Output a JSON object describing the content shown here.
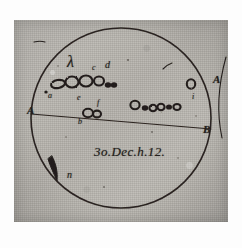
{
  "document": {
    "kind": "historical-astronomical-drawing",
    "subject": "sunspot observation sketch",
    "date_inscription": "3o.Dec.h.12.",
    "paper_color": "#b8b5b0",
    "ink_color": "#241f1c"
  },
  "disk": {
    "name": "solar-disk",
    "center_x": 121,
    "center_y": 118,
    "radius": 90
  },
  "diameter_line": {
    "label_left": "A",
    "label_right": "B",
    "x1": 31,
    "y1": 114,
    "x2": 211,
    "y2": 129
  },
  "marginal_labels": [
    {
      "text": "A",
      "x": 27,
      "y": 105,
      "size": "cap"
    },
    {
      "text": "B",
      "x": 203,
      "y": 124,
      "size": "cap"
    },
    {
      "text": "A",
      "x": 213,
      "y": 74,
      "size": "cap"
    }
  ],
  "spot_labels": [
    {
      "text": "λ",
      "x": 67,
      "y": 54,
      "size": "glyph"
    },
    {
      "text": "c",
      "x": 92,
      "y": 64,
      "size": "small"
    },
    {
      "text": "d",
      "x": 105,
      "y": 60,
      "size": "mid"
    },
    {
      "text": "a",
      "x": 48,
      "y": 92,
      "size": "small"
    },
    {
      "text": "e",
      "x": 77,
      "y": 94,
      "size": "small"
    },
    {
      "text": "f",
      "x": 97,
      "y": 99,
      "size": "small"
    },
    {
      "text": "b",
      "x": 78,
      "y": 118,
      "size": "small"
    },
    {
      "text": "i",
      "x": 192,
      "y": 93,
      "size": "small"
    },
    {
      "text": "n",
      "x": 67,
      "y": 170,
      "size": "mid"
    }
  ],
  "date_text": {
    "text": "3o.Dec.h.12.",
    "x": 94,
    "y": 145
  },
  "spot_groups": [
    {
      "name": "upper-left-cluster",
      "spots": [
        {
          "cx": 58,
          "cy": 84,
          "rx": 7.0,
          "ry": 4.0,
          "rot": -10,
          "filled": false
        },
        {
          "cx": 72,
          "cy": 82,
          "rx": 6.5,
          "ry": 5.5,
          "rot": 0,
          "filled": false
        },
        {
          "cx": 86,
          "cy": 81,
          "rx": 6.5,
          "ry": 5.5,
          "rot": 0,
          "filled": false
        },
        {
          "cx": 99,
          "cy": 81,
          "rx": 5.0,
          "ry": 4.5,
          "rot": 0,
          "filled": false
        },
        {
          "cx": 108,
          "cy": 85,
          "rx": 3.2,
          "ry": 2.8,
          "rot": 0,
          "filled": true
        },
        {
          "cx": 114,
          "cy": 85,
          "rx": 3.2,
          "ry": 2.8,
          "rot": 0,
          "filled": true
        },
        {
          "cx": 46,
          "cy": 92,
          "rx": 1.7,
          "ry": 1.5,
          "rot": 0,
          "filled": true
        }
      ]
    },
    {
      "name": "center-lower-pair",
      "spots": [
        {
          "cx": 88,
          "cy": 113,
          "rx": 5.0,
          "ry": 4.2,
          "rot": 0,
          "filled": false
        },
        {
          "cx": 97,
          "cy": 114,
          "rx": 4.0,
          "ry": 3.4,
          "rot": 0,
          "filled": false
        }
      ]
    },
    {
      "name": "right-chain",
      "spots": [
        {
          "cx": 135,
          "cy": 105,
          "rx": 4.6,
          "ry": 4.2,
          "rot": 0,
          "filled": false
        },
        {
          "cx": 145,
          "cy": 108,
          "rx": 3.2,
          "ry": 2.8,
          "rot": 0,
          "filled": true
        },
        {
          "cx": 153,
          "cy": 108,
          "rx": 3.6,
          "ry": 3.2,
          "rot": 0,
          "filled": false
        },
        {
          "cx": 161,
          "cy": 107,
          "rx": 3.6,
          "ry": 3.2,
          "rot": 0,
          "filled": false
        },
        {
          "cx": 169,
          "cy": 107,
          "rx": 3.0,
          "ry": 2.6,
          "rot": 0,
          "filled": true
        },
        {
          "cx": 177,
          "cy": 107,
          "rx": 3.6,
          "ry": 3.0,
          "rot": 0,
          "filled": false
        }
      ]
    },
    {
      "name": "right-edge-spot",
      "spots": [
        {
          "cx": 191,
          "cy": 84,
          "rx": 4.2,
          "ry": 4.8,
          "rot": 0,
          "filled": false
        }
      ]
    }
  ],
  "strokes": [
    {
      "name": "crescent-mark-lower-left",
      "d": "M 52,156 C 56,164 58,172 57,181 C 54,174 50,166 48,159 Z"
    },
    {
      "name": "faint-stroke-upper-right",
      "d": "M 163,69 C 166,66 169,64 172,63"
    },
    {
      "name": "faint-mark-top-left",
      "d": "M 34,42 C 38,41 42,41 45,42"
    },
    {
      "name": "edge-curve-right",
      "d": "M 226,57 C 219,82 216,110 222,138"
    }
  ],
  "speck_dots": [
    {
      "cx": 128,
      "cy": 60,
      "r": 1.1
    },
    {
      "cx": 152,
      "cy": 132,
      "r": 0.9
    },
    {
      "cx": 66,
      "cy": 137,
      "r": 0.8
    },
    {
      "cx": 178,
      "cy": 158,
      "r": 0.8
    },
    {
      "cx": 104,
      "cy": 187,
      "r": 0.9
    },
    {
      "cx": 58,
      "cy": 66,
      "r": 0.8
    },
    {
      "cx": 196,
      "cy": 116,
      "r": 0.8
    }
  ]
}
